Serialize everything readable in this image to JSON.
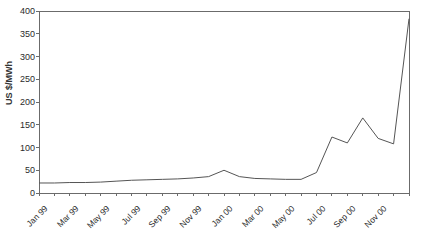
{
  "chart_data": {
    "type": "line",
    "title": "",
    "subtitle": "",
    "xlabel": "",
    "ylabel": "US $/MWh",
    "ylim": [
      0,
      400
    ],
    "ytick_values": [
      0,
      50,
      100,
      150,
      200,
      250,
      300,
      350,
      400
    ],
    "ytick_labels": [
      "0",
      "50",
      "100",
      "150",
      "200",
      "250",
      "300",
      "350",
      "400"
    ],
    "grid": false,
    "legend": null,
    "line_color": "#555555",
    "categories": [
      "Jan 99",
      "Feb 99",
      "Mar 99",
      "Apr 99",
      "May 99",
      "Jun 99",
      "Jul 99",
      "Aug 99",
      "Sep 99",
      "Oct 99",
      "Nov 99",
      "Dec 99",
      "Jan 00",
      "Feb 00",
      "Mar 00",
      "Apr 00",
      "May 00",
      "Jun 00",
      "Jul 00",
      "Aug 00",
      "Sep 00",
      "Oct 00",
      "Nov 00",
      "Dec 00",
      "Jan 01"
    ],
    "xtick_labels": [
      "Jan 99",
      "Mar 99",
      "May 99",
      "Jul 99",
      "Sep 99",
      "Nov 99",
      "Jan 00",
      "Mar 00",
      "May 00",
      "Jul 00",
      "Sep 00",
      "Nov 00"
    ],
    "xtick_indices": [
      0,
      2,
      4,
      6,
      8,
      10,
      12,
      14,
      16,
      18,
      20,
      22
    ],
    "values": [
      22,
      22,
      23,
      23,
      24,
      26,
      28,
      29,
      30,
      31,
      33,
      36,
      50,
      36,
      32,
      31,
      30,
      30,
      45,
      123,
      110,
      165,
      120,
      108,
      383
    ],
    "series": [
      {
        "name": "US $/MWh",
        "values": [
          22,
          22,
          23,
          23,
          24,
          26,
          28,
          29,
          30,
          31,
          33,
          36,
          50,
          36,
          32,
          31,
          30,
          30,
          45,
          123,
          110,
          165,
          120,
          108,
          383
        ]
      }
    ]
  }
}
